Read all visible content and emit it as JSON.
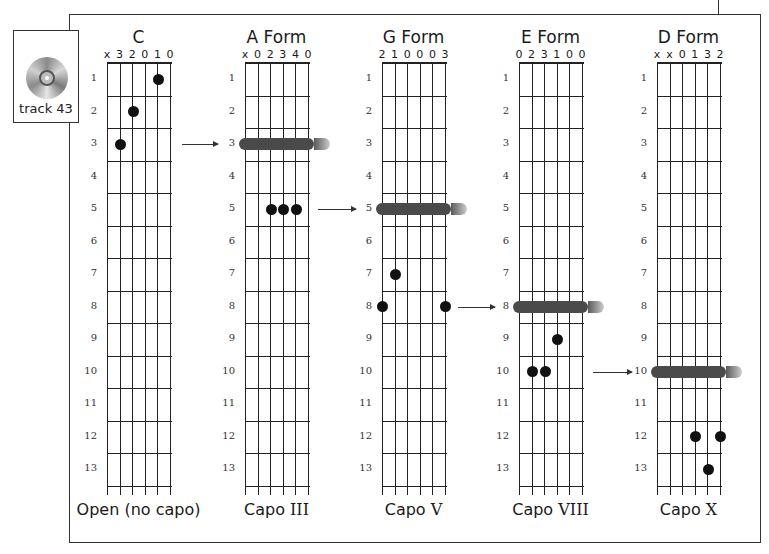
{
  "track": {
    "label": "track 43",
    "icon": "cd-icon"
  },
  "layout": {
    "fret_top": 63,
    "fret_height": 32.5,
    "num_frets": 13,
    "string_gap": 12.6
  },
  "chords": [
    {
      "id": "c",
      "title": "C",
      "grid_x": 107,
      "open_strings": [
        "x",
        "3",
        "2",
        "0",
        "1",
        "0"
      ],
      "caption_main": "Open (no capo)",
      "caption_roman": "",
      "capo_fret": null,
      "dots": [
        {
          "string": 5,
          "fret": 1
        },
        {
          "string": 3,
          "fret": 2
        },
        {
          "string": 2,
          "fret": 3
        }
      ]
    },
    {
      "id": "a-form",
      "title": "A Form",
      "grid_x": 245,
      "open_strings": [
        "x",
        "0",
        "2",
        "3",
        "4",
        "0"
      ],
      "caption_main": "Capo ",
      "caption_roman": "III",
      "capo_fret": 3,
      "dots": [
        {
          "string": 3,
          "fret": 5
        },
        {
          "string": 4,
          "fret": 5
        },
        {
          "string": 5,
          "fret": 5
        }
      ]
    },
    {
      "id": "g-form",
      "title": "G Form",
      "grid_x": 382,
      "open_strings": [
        "2",
        "1",
        "0",
        "0",
        "0",
        "3"
      ],
      "caption_main": "Capo ",
      "caption_roman": "V",
      "capo_fret": 5,
      "dots": [
        {
          "string": 2,
          "fret": 7
        },
        {
          "string": 1,
          "fret": 8
        },
        {
          "string": 6,
          "fret": 8
        }
      ]
    },
    {
      "id": "e-form",
      "title": "E Form",
      "grid_x": 519,
      "open_strings": [
        "0",
        "2",
        "3",
        "1",
        "0",
        "0"
      ],
      "caption_main": "Capo ",
      "caption_roman": "VIII",
      "capo_fret": 8,
      "dots": [
        {
          "string": 4,
          "fret": 9
        },
        {
          "string": 2,
          "fret": 10
        },
        {
          "string": 3,
          "fret": 10
        }
      ]
    },
    {
      "id": "d-form",
      "title": "D Form",
      "grid_x": 657,
      "open_strings": [
        "x",
        "x",
        "0",
        "1",
        "3",
        "2"
      ],
      "caption_main": "Capo ",
      "caption_roman": "X",
      "capo_fret": 10,
      "dots": [
        {
          "string": 4,
          "fret": 12
        },
        {
          "string": 6,
          "fret": 12
        },
        {
          "string": 5,
          "fret": 13
        }
      ]
    }
  ],
  "arrows": [
    {
      "from": "c",
      "to": "a-form",
      "fret": 3,
      "x1": 182,
      "x2": 218
    },
    {
      "from": "a-form",
      "to": "g-form",
      "fret": 5,
      "x1": 318,
      "x2": 356
    },
    {
      "from": "g-form",
      "to": "e-form",
      "fret": 8,
      "x1": 458,
      "x2": 495
    },
    {
      "from": "e-form",
      "to": "d-form",
      "fret": 10,
      "x1": 593,
      "x2": 632
    }
  ],
  "fret_numbers": [
    "1",
    "2",
    "3",
    "4",
    "5",
    "6",
    "7",
    "8",
    "9",
    "10",
    "11",
    "12",
    "13"
  ]
}
